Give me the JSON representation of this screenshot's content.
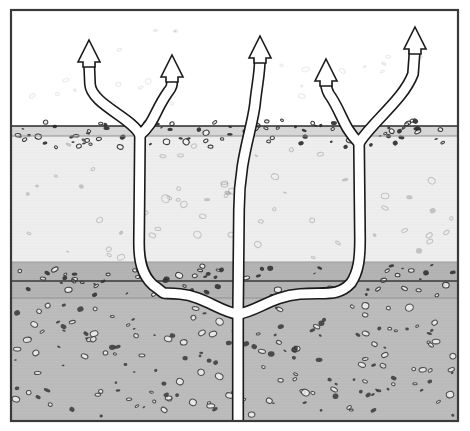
{
  "figure": {
    "type": "cross-section-diagram",
    "width": 470,
    "height": 431,
    "background_color": "#ffffff",
    "frame": {
      "x": 11,
      "y": 10,
      "width": 447,
      "height": 411,
      "stroke_color": "#3a3a3a",
      "stroke_width": 2.2,
      "fill_color": "#ffffff"
    }
  },
  "layers": [
    {
      "name": "atmosphere-air",
      "label": "Air / above ground",
      "y_top": 10,
      "y_bottom": 126,
      "color": "#ffffff",
      "speckle_density": "very-low",
      "speckle_color": "#e8e8e8"
    },
    {
      "name": "surface-soil-band",
      "label": "Surface soil band",
      "y_top": 126,
      "y_bottom": 136,
      "color": "#d8d8d8",
      "speckle_density": "none",
      "speckle_color": "#bcbcbc"
    },
    {
      "name": "upper-aquifer",
      "label": "Upper permeable unit",
      "y_top": 136,
      "y_bottom": 262,
      "color": "#efefef",
      "speckle_density": "low",
      "speckle_color": "#c9c9c9"
    },
    {
      "name": "aquitard-dark-band",
      "label": "Low-permeability confining band",
      "y_top": 262,
      "y_bottom": 298,
      "color": "#b5b5b5",
      "speckle_density": "medium",
      "speckle_color": "#4a4a4a"
    },
    {
      "name": "lower-reservoir",
      "label": "Lower reservoir unit",
      "y_top": 298,
      "y_bottom": 421,
      "color": "#bdbdbd",
      "speckle_density": "high",
      "speckle_color": "#4a4a4a"
    }
  ],
  "boundary_lines": [
    {
      "name": "boundary-air-to-surface",
      "y": 126,
      "color": "#2a2a2a",
      "width": 1.6
    },
    {
      "name": "boundary-surface-to-upper",
      "y": 136,
      "color": "#8e8e8e",
      "width": 1.0
    },
    {
      "name": "boundary-upper-to-aquitard",
      "y": 262,
      "color": "#9a9a9a",
      "width": 1.0
    },
    {
      "name": "boundary-aquitard-top-dark",
      "y": 281,
      "color": "#3a3a3a",
      "width": 1.4
    },
    {
      "name": "boundary-aquitard-to-lower",
      "y": 298,
      "color": "#8e8e8e",
      "width": 1.0
    }
  ],
  "pathways": {
    "stroke_color": "#1a1a1a",
    "fill_color": "#ffffff",
    "stroke_width": 1.6,
    "channel_width": 9,
    "description": "Branching white migration conduits rising from a deep feeder to five surface vents",
    "branches": [
      {
        "name": "trunk-feeder",
        "label": "Deep vertical feeder conduit",
        "arrow": false
      },
      {
        "name": "left-lateral",
        "label": "Left lateral conduit",
        "arrow": false
      },
      {
        "name": "right-lateral",
        "label": "Right lateral conduit",
        "arrow": false
      },
      {
        "name": "left-outer-riser",
        "label": "Left outer riser",
        "arrow": true
      },
      {
        "name": "left-inner-riser",
        "label": "Left inner riser",
        "arrow": true
      },
      {
        "name": "center-riser",
        "label": "Center riser",
        "arrow": true
      },
      {
        "name": "right-inner-riser",
        "label": "Right inner riser",
        "arrow": true
      },
      {
        "name": "right-outer-riser",
        "label": "Right outer riser",
        "arrow": true
      }
    ]
  },
  "arrows": [
    {
      "name": "arrow-left-outer",
      "tip_x": 89,
      "tip_y": 40,
      "direction": "up",
      "label": "Vent 1"
    },
    {
      "name": "arrow-left-inner",
      "tip_x": 172,
      "tip_y": 55,
      "direction": "up",
      "label": "Vent 2"
    },
    {
      "name": "arrow-center",
      "tip_x": 260,
      "tip_y": 36,
      "direction": "up",
      "label": "Vent 3"
    },
    {
      "name": "arrow-right-inner",
      "tip_x": 326,
      "tip_y": 59,
      "direction": "up",
      "label": "Vent 4"
    },
    {
      "name": "arrow-right-outer",
      "tip_x": 415,
      "tip_y": 27,
      "direction": "up",
      "label": "Vent 5"
    }
  ],
  "arrow_style": {
    "head_half_width": 11,
    "head_height": 22,
    "shaft_half_width": 4.5,
    "fill_color": "#ffffff",
    "stroke_color": "#1a1a1a",
    "stroke_width": 1.6
  },
  "clasts": {
    "description": "Scattered elliptical grains and pebbles, some dark-filled and some light-filled with dark rims",
    "dark_fill": "#2f2f2f",
    "light_fill": "#f2f2f2",
    "rim_color": "#2f2f2f"
  }
}
